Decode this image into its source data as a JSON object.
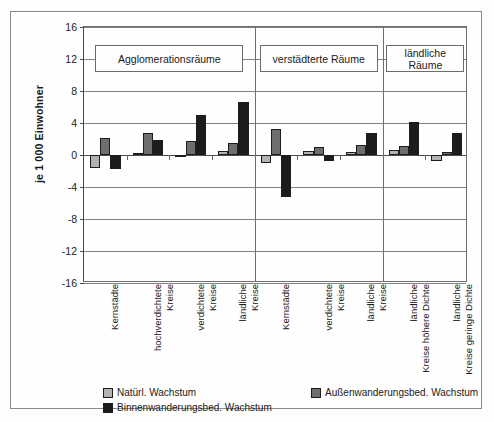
{
  "chart_data": {
    "type": "bar",
    "title": "",
    "subtitle": "",
    "xlabel": "",
    "ylabel": "je 1 000 Einwohner",
    "ylim": [
      -16,
      16
    ],
    "yticks": [
      16,
      12,
      8,
      4,
      0,
      -4,
      -8,
      -12,
      -16
    ],
    "ytick_labels": [
      "16",
      "12",
      "8",
      "4",
      "0",
      "-4",
      "-8",
      "-12",
      "-16"
    ],
    "grid": true,
    "legend_position": "bottom",
    "groups": [
      {
        "label": "Agglomerationsräume",
        "categories": [
          "Kernstädte",
          "hochverdichtete Kreise",
          "verdichtete Kreise",
          "ländliche Kreise"
        ]
      },
      {
        "label": "verstädterte Räume",
        "categories": [
          "Kernstädte",
          "verdichtete Kreise",
          "ländliche Kreise"
        ]
      },
      {
        "label": "ländliche Räume",
        "categories": [
          "ländliche Kreise höhere Dichte",
          "ländliche Kreise geringe Dichte"
        ]
      }
    ],
    "categories": [
      "Kernstädte",
      "hochverdichtete Kreise",
      "verdichtete Kreise",
      "ländliche Kreise",
      "Kernstädte",
      "verdichtete Kreise",
      "ländliche Kreise",
      "ländliche Kreise höhere Dichte",
      "ländliche Kreise geringe Dichte"
    ],
    "series": [
      {
        "name": "Natürl. Wachstum",
        "color": "#b2b2b2",
        "values": [
          -1.6,
          0.3,
          -0.3,
          0.5,
          -1.0,
          0.5,
          0.4,
          0.6,
          -0.8
        ]
      },
      {
        "name": "Außenwanderungsbed. Wachstum",
        "color": "#6e6e6e",
        "values": [
          2.1,
          2.8,
          1.8,
          1.5,
          3.3,
          1.0,
          1.2,
          1.1,
          0.4
        ]
      },
      {
        "name": "Binnenwanderungsbed. Wachstum",
        "color": "#1c1c1c",
        "values": [
          -1.8,
          1.9,
          5.0,
          6.6,
          -5.2,
          -0.8,
          2.8,
          4.1,
          2.8
        ]
      }
    ]
  },
  "legend": {
    "items": [
      {
        "label": "Natürl. Wachstum",
        "swatch": "s0"
      },
      {
        "label": "Außenwanderungsbed. Wachstum",
        "swatch": "s1"
      },
      {
        "label": "Binnenwanderungsbed. Wachstum",
        "swatch": "s2"
      }
    ]
  }
}
